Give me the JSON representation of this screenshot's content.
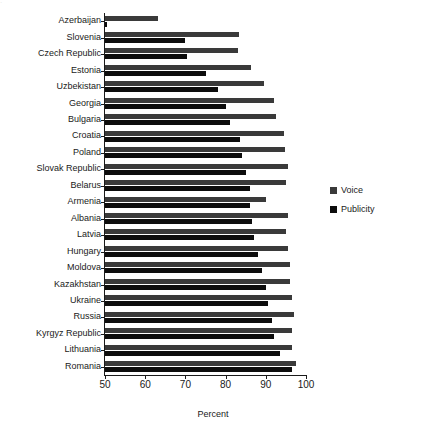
{
  "chart_data": {
    "type": "bar",
    "orientation": "horizontal",
    "title": "",
    "xlabel": "Percent",
    "ylabel": "",
    "xlim": [
      50,
      100
    ],
    "xticks": [
      50,
      60,
      70,
      80,
      90,
      100
    ],
    "xticklabels": [
      "50",
      "60",
      "70",
      "80",
      "90",
      "100"
    ],
    "grid": false,
    "legend_position": "right-middle",
    "categories": [
      "Azerbaijan",
      "Slovenia",
      "Czech Republic",
      "Estonia",
      "Uzbekistan",
      "Georgia",
      "Bulgaria",
      "Croatia",
      "Poland",
      "Slovak Republic",
      "Belarus",
      "Armenia",
      "Albania",
      "Latvia",
      "Hungary",
      "Moldova",
      "Kazakhstan",
      "Ukraine",
      "Russia",
      "Kyrgyz Republic",
      "Lithuania",
      "Romania"
    ],
    "series": [
      {
        "name": "Voice",
        "color": "#3a3a3a",
        "values": [
          63.2,
          83.4,
          83.0,
          86.3,
          89.5,
          92.0,
          92.5,
          94.5,
          94.8,
          95.5,
          95.0,
          90.0,
          95.5,
          95.0,
          95.5,
          96.0,
          96.0,
          96.5,
          97.0,
          96.5,
          96.5,
          97.5
        ]
      },
      {
        "name": "Publicity",
        "color": "#0d0d0d",
        "values": [
          50.5,
          70.0,
          70.5,
          75.0,
          78.0,
          80.0,
          81.0,
          83.5,
          84.0,
          85.0,
          86.0,
          86.0,
          86.5,
          87.0,
          88.0,
          89.0,
          90.0,
          90.5,
          91.5,
          92.0,
          93.5,
          96.5
        ]
      }
    ]
  },
  "legend": {
    "items": [
      {
        "label": "Voice",
        "swatch": "voice"
      },
      {
        "label": "Publicity",
        "swatch": "publicity"
      }
    ]
  },
  "axis_title": "Percent",
  "top_artifact": "."
}
